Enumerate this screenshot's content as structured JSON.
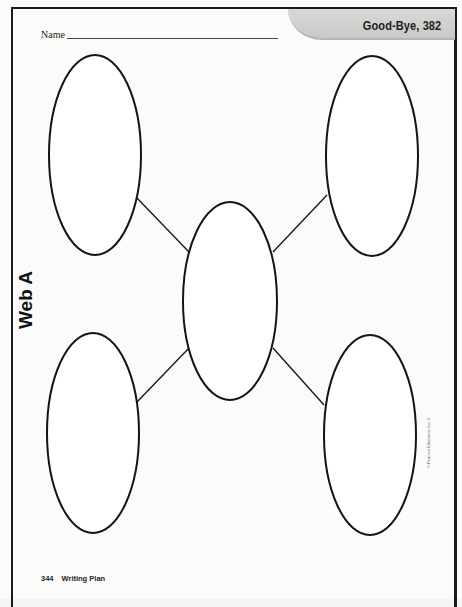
{
  "header": {
    "name_label": "Name",
    "tab_title": "Good-Bye, 382"
  },
  "side_title": "Web A",
  "web": {
    "center": {
      "label": "",
      "cx": 230,
      "cy": 301,
      "rx": 47,
      "ry": 99
    },
    "outer": [
      {
        "id": "top-left",
        "label": "",
        "cx": 95,
        "cy": 155,
        "rx": 46,
        "ry": 100
      },
      {
        "id": "top-right",
        "label": "",
        "cx": 372,
        "cy": 156,
        "rx": 46,
        "ry": 100
      },
      {
        "id": "bottom-left",
        "label": "",
        "cx": 93,
        "cy": 433,
        "rx": 46,
        "ry": 100
      },
      {
        "id": "bottom-right",
        "label": "",
        "cx": 370,
        "cy": 435,
        "rx": 46,
        "ry": 100
      }
    ]
  },
  "copyright": "© Pearson Education, Inc. 3",
  "footer": {
    "page_number": "344",
    "section": "Writing Plan"
  }
}
